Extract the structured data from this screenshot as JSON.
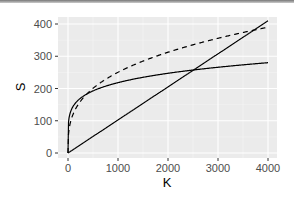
{
  "chart_data": {
    "type": "line",
    "title": "",
    "xlabel": "K",
    "ylabel": "S",
    "xlim": [
      -100,
      4100
    ],
    "ylim": [
      -10,
      420
    ],
    "xticks": [
      0,
      1000,
      2000,
      3000,
      4000
    ],
    "yticks": [
      0,
      100,
      200,
      300,
      400
    ],
    "grid": true,
    "legend": "none",
    "series": [
      {
        "name": "linear",
        "style": "solid",
        "x": [
          0,
          1000,
          2000,
          3000,
          4000
        ],
        "values": [
          0,
          102,
          204,
          307,
          410
        ]
      },
      {
        "name": "log-like solid",
        "style": "solid",
        "x": [
          0,
          50,
          200,
          500,
          1000,
          2000,
          3000,
          4000
        ],
        "values": [
          0,
          85,
          125,
          160,
          185,
          220,
          255,
          280
        ]
      },
      {
        "name": "power dashed",
        "style": "dashed",
        "x": [
          0,
          50,
          200,
          500,
          1000,
          2000,
          3000,
          4000
        ],
        "values": [
          0,
          70,
          140,
          200,
          250,
          310,
          355,
          390
        ]
      }
    ]
  },
  "labels": {
    "x": "K",
    "y": "S",
    "xticks": [
      "0",
      "1000",
      "2000",
      "3000",
      "4000"
    ],
    "yticks": [
      "0",
      "100",
      "200",
      "300",
      "400"
    ]
  }
}
